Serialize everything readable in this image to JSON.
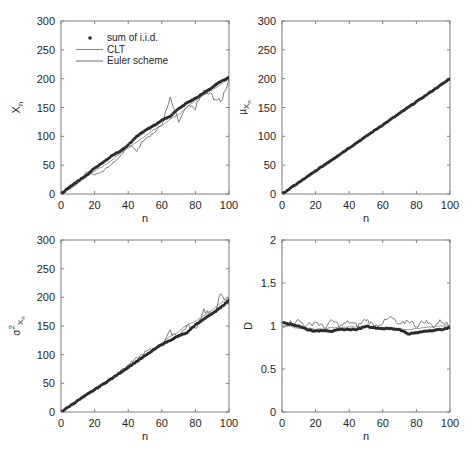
{
  "figure": {
    "width": 474,
    "height": 460,
    "colors": {
      "axis": "#7f7f7f",
      "text": "#262626",
      "iid": "#2b2b2b",
      "clt": "#8a8a8a",
      "euler": "#6e6e6e"
    }
  },
  "legend": {
    "entries": [
      {
        "label": "sum of i.i.d.",
        "marker": "dot"
      },
      {
        "label": "CLT",
        "marker": "line"
      },
      {
        "label": "Euler scheme",
        "marker": "line"
      }
    ]
  },
  "chart_data": [
    {
      "type": "line",
      "panel": "top-left",
      "title": "",
      "xlabel": "n",
      "ylabel": "X_n",
      "xlim": [
        0,
        100
      ],
      "ylim": [
        0,
        300
      ],
      "xticks": [
        0,
        20,
        40,
        60,
        80,
        100
      ],
      "yticks": [
        0,
        50,
        100,
        150,
        200,
        250,
        300
      ],
      "grid": false,
      "legend_position": "upper-left",
      "data_note": "Approximate values estimated from the rendered curves; not exact source data.",
      "x": [
        0,
        5,
        10,
        15,
        20,
        25,
        30,
        35,
        40,
        45,
        50,
        55,
        60,
        65,
        70,
        75,
        80,
        85,
        90,
        95,
        100
      ],
      "series": [
        {
          "name": "sum of i.i.d.",
          "style": "markers",
          "values": [
            0,
            12,
            22,
            32,
            45,
            55,
            66,
            74,
            85,
            100,
            110,
            118,
            128,
            135,
            148,
            158,
            166,
            175,
            185,
            195,
            202
          ]
        },
        {
          "name": "CLT",
          "style": "line",
          "values": [
            0,
            15,
            25,
            30,
            40,
            48,
            58,
            70,
            80,
            90,
            100,
            112,
            118,
            130,
            138,
            150,
            162,
            172,
            180,
            190,
            200
          ]
        },
        {
          "name": "Euler scheme",
          "style": "line",
          "values": [
            0,
            8,
            18,
            38,
            34,
            40,
            52,
            65,
            85,
            75,
            98,
            105,
            120,
            165,
            125,
            150,
            150,
            178,
            170,
            158,
            200
          ]
        }
      ]
    },
    {
      "type": "line",
      "panel": "top-right",
      "title": "",
      "xlabel": "n",
      "ylabel": "μ_{X_n}",
      "xlim": [
        0,
        100
      ],
      "ylim": [
        0,
        300
      ],
      "xticks": [
        0,
        20,
        40,
        60,
        80,
        100
      ],
      "yticks": [
        0,
        50,
        100,
        150,
        200,
        250,
        300
      ],
      "grid": false,
      "data_note": "Approximate values estimated from the rendered curves; not exact source data.",
      "x": [
        0,
        10,
        20,
        30,
        40,
        50,
        60,
        70,
        80,
        90,
        100
      ],
      "series": [
        {
          "name": "sum of i.i.d.",
          "style": "markers",
          "values": [
            0,
            20,
            40,
            60,
            80,
            100,
            120,
            140,
            160,
            180,
            200
          ]
        },
        {
          "name": "CLT",
          "style": "line",
          "values": [
            0,
            20,
            40,
            60,
            80,
            100,
            120,
            140,
            160,
            180,
            200
          ]
        },
        {
          "name": "Euler scheme",
          "style": "line",
          "values": [
            0,
            20,
            40,
            60,
            80,
            100,
            120,
            140,
            160,
            180,
            200
          ]
        }
      ]
    },
    {
      "type": "line",
      "panel": "bottom-left",
      "title": "",
      "xlabel": "n",
      "ylabel": "σ²_{X_n}",
      "xlim": [
        0,
        100
      ],
      "ylim": [
        0,
        300
      ],
      "xticks": [
        0,
        20,
        40,
        60,
        80,
        100
      ],
      "yticks": [
        0,
        50,
        100,
        150,
        200,
        250,
        300
      ],
      "grid": false,
      "data_note": "Approximate values estimated from the rendered curves; not exact source data.",
      "x": [
        0,
        10,
        20,
        30,
        40,
        50,
        60,
        65,
        70,
        75,
        80,
        85,
        90,
        95,
        100
      ],
      "series": [
        {
          "name": "sum of i.i.d.",
          "style": "markers",
          "values": [
            0,
            20,
            39,
            58,
            78,
            98,
            118,
            125,
            133,
            138,
            152,
            162,
            172,
            182,
            195
          ]
        },
        {
          "name": "CLT",
          "style": "line",
          "values": [
            0,
            20,
            40,
            60,
            80,
            100,
            120,
            132,
            140,
            152,
            158,
            168,
            178,
            190,
            198
          ]
        },
        {
          "name": "Euler scheme",
          "style": "line",
          "values": [
            0,
            20,
            40,
            60,
            82,
            104,
            118,
            140,
            132,
            150,
            145,
            178,
            168,
            202,
            190
          ]
        }
      ]
    },
    {
      "type": "line",
      "panel": "bottom-right",
      "title": "",
      "xlabel": "n",
      "ylabel": "D",
      "xlim": [
        0,
        100
      ],
      "ylim": [
        0,
        2
      ],
      "xticks": [
        0,
        20,
        40,
        60,
        80,
        100
      ],
      "yticks": [
        0,
        0.5,
        1,
        1.5,
        2
      ],
      "grid": false,
      "data_note": "Approximate values estimated from the rendered curves; not exact source data.",
      "x": [
        0,
        5,
        10,
        15,
        20,
        25,
        30,
        35,
        40,
        45,
        50,
        55,
        60,
        65,
        70,
        75,
        80,
        85,
        90,
        95,
        100
      ],
      "series": [
        {
          "name": "sum of i.i.d.",
          "style": "markers",
          "values": [
            1.05,
            1.02,
            1.0,
            0.96,
            0.94,
            0.95,
            0.94,
            0.96,
            0.96,
            0.96,
            1.0,
            0.98,
            0.97,
            0.97,
            0.96,
            0.91,
            0.92,
            0.94,
            0.95,
            0.96,
            0.98
          ]
        },
        {
          "name": "CLT",
          "style": "line",
          "values": [
            1.0,
            1.0,
            0.97,
            0.98,
            0.96,
            0.97,
            0.98,
            0.98,
            0.99,
            0.99,
            1.0,
            0.99,
            0.98,
            0.98,
            0.97,
            0.96,
            0.97,
            0.98,
            0.99,
            1.0,
            1.0
          ]
        },
        {
          "name": "Euler scheme",
          "style": "line",
          "values": [
            1.0,
            1.04,
            1.06,
            1.0,
            1.05,
            0.98,
            1.06,
            1.0,
            1.05,
            1.0,
            1.08,
            1.0,
            1.04,
            1.1,
            1.0,
            1.07,
            1.0,
            1.06,
            1.0,
            1.06,
            1.0
          ]
        }
      ]
    }
  ]
}
